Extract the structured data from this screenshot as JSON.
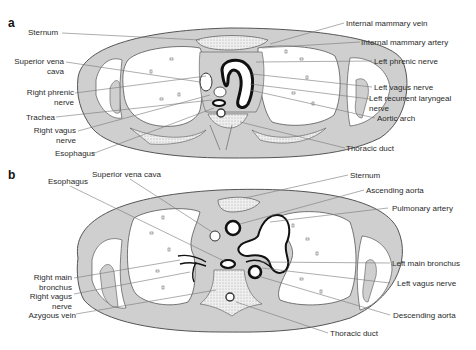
{
  "colors": {
    "tissue": "#cfcfcf",
    "outline": "#555555",
    "lung": "#ffffff",
    "vessel": "#111111",
    "leader": "#777777"
  },
  "panel_a": {
    "label": "a",
    "left_labels": [
      {
        "text": "Sternum"
      },
      {
        "text": "Superior vena",
        "text2": "cava"
      },
      {
        "text": "Right phrenic",
        "text2": "nerve"
      },
      {
        "text": "Trachea"
      },
      {
        "text": "Right vagus",
        "text2": "nerve"
      },
      {
        "text": "Esophagus"
      }
    ],
    "right_labels": [
      {
        "text": "Internal mammary vein"
      },
      {
        "text": "Internal mammary artery"
      },
      {
        "text": "Left phrenic nerve"
      },
      {
        "text": "Left vagus nerve"
      },
      {
        "text": "Left recurrent laryngeal",
        "text2": "nerve"
      },
      {
        "text": "Aortic arch"
      },
      {
        "text": "Thoracic duct"
      }
    ]
  },
  "panel_b": {
    "label": "b",
    "top_labels": [
      {
        "text": "Esophagus"
      },
      {
        "text": "Superior vena cava"
      }
    ],
    "left_labels": [
      {
        "text": "Right main",
        "text2": "bronchus"
      },
      {
        "text": "Right vagus",
        "text2": "nerve"
      },
      {
        "text": "Azygous vein"
      }
    ],
    "right_labels": [
      {
        "text": "Sternum"
      },
      {
        "text": "Ascending aorta"
      },
      {
        "text": "Pulmonary artery"
      },
      {
        "text": "Left main bronchus"
      },
      {
        "text": "Left vagus nerve"
      },
      {
        "text": "Descending aorta"
      },
      {
        "text": "Thoracic duct"
      }
    ]
  }
}
